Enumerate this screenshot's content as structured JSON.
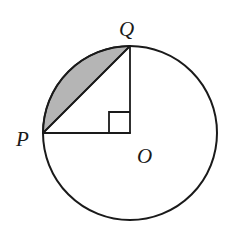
{
  "figure": {
    "background_color": "#ffffff",
    "stroke_color": "#1a1a1a",
    "shaded_color": "#b5b5b5",
    "shaded_stroke_color": "#1a1a1a",
    "circle": {
      "name": "main-circle",
      "center_x": 130,
      "center_y": 133,
      "radius": 87,
      "stroke_width": 2.0
    },
    "points": [
      {
        "id": "P",
        "label": "P",
        "x": 43,
        "y": 133,
        "label_x": 16,
        "label_y": 146
      },
      {
        "id": "Q",
        "label": "Q",
        "x": 130,
        "y": 46,
        "label_x": 119,
        "label_y": 36
      },
      {
        "id": "O",
        "label": "O",
        "x": 130,
        "y": 133,
        "label_x": 137,
        "label_y": 163
      }
    ],
    "segments": [
      {
        "name": "radius-PO",
        "x1": 43,
        "y1": 133,
        "x2": 130,
        "y2": 133,
        "stroke_width": 1.8
      },
      {
        "name": "radius-OQ",
        "x1": 130,
        "y1": 133,
        "x2": 130,
        "y2": 46,
        "stroke_width": 1.8
      },
      {
        "name": "chord-PQ",
        "x1": 43,
        "y1": 133,
        "x2": 130,
        "y2": 46,
        "stroke_width": 1.8
      }
    ],
    "right_angle_mark": {
      "name": "right-angle-mark-at-O",
      "vertex_x": 130,
      "vertex_y": 133,
      "size": 21,
      "stroke_width": 1.8,
      "path": "M 109 133 L 109 112 L 130 112"
    },
    "shaded_segment": {
      "name": "shaded-circular-segment-PQ",
      "description": "Region bounded by chord PQ and the minor arc from P to Q",
      "path": "M 43 133 A 87 87 0 0 1 130 46 L 43 133 Z"
    }
  }
}
